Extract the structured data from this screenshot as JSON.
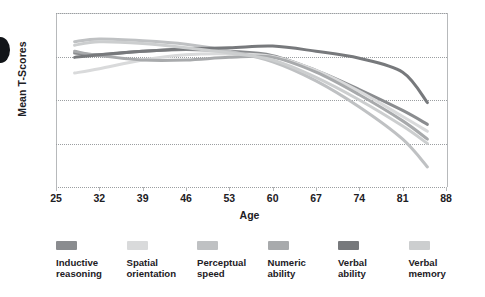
{
  "chart_data": {
    "type": "line",
    "title": "",
    "xlabel": "Age",
    "ylabel": "Mean T-Scores",
    "xlim": [
      25,
      88
    ],
    "ylim": [
      35,
      55
    ],
    "xticks": [
      "25",
      "32",
      "39",
      "46",
      "53",
      "60",
      "67",
      "74",
      "81",
      "88"
    ],
    "yticks": [
      "55",
      "50",
      "45",
      "40",
      "35"
    ],
    "grid": "horizontal-dotted",
    "legend_position": "bottom",
    "x": [
      28,
      32,
      39,
      46,
      53,
      60,
      67,
      74,
      81,
      85
    ],
    "series": [
      {
        "name": "Inductive reasoning",
        "color": "#8a8c8f",
        "values": [
          50.4,
          50.2,
          50.6,
          50.8,
          50.6,
          50.1,
          48.4,
          46.2,
          43.8,
          42.2
        ]
      },
      {
        "name": "Spatial orientation",
        "color": "#d9dadb",
        "values": [
          48.1,
          48.6,
          49.6,
          50.2,
          50.3,
          50.0,
          48.4,
          46.0,
          43.1,
          41.4
        ]
      },
      {
        "name": "Perceptual speed",
        "color": "#bfc1c3",
        "values": [
          51.7,
          52.0,
          51.8,
          51.4,
          50.6,
          49.4,
          47.2,
          44.2,
          40.5,
          37.3
        ]
      },
      {
        "name": "Numeric ability",
        "color": "#a8aaac",
        "values": [
          50.6,
          50.1,
          49.6,
          49.6,
          49.9,
          49.9,
          48.2,
          45.6,
          42.6,
          40.5
        ]
      },
      {
        "name": "Verbal ability",
        "color": "#77797c",
        "values": [
          49.9,
          50.2,
          50.6,
          50.9,
          51.0,
          51.2,
          50.6,
          49.8,
          48.2,
          44.7
        ]
      },
      {
        "name": "Verbal memory",
        "color": "#cccecf",
        "values": [
          51.3,
          51.7,
          51.5,
          51.0,
          50.4,
          49.6,
          47.6,
          45.0,
          42.0,
          40.0
        ]
      }
    ]
  },
  "axes": {
    "y_title": "Mean T-Scores",
    "x_title": "Age",
    "y_tick_labels": [
      "55",
      "50",
      "45",
      "40",
      "35"
    ],
    "x_tick_labels": [
      "25",
      "32",
      "39",
      "46",
      "53",
      "60",
      "67",
      "74",
      "81",
      "88"
    ]
  },
  "legend": {
    "items": [
      {
        "label_line1": "Inductive",
        "label_line2": "reasoning",
        "color": "#8a8c8f"
      },
      {
        "label_line1": "Spatial",
        "label_line2": "orientation",
        "color": "#d9dadb"
      },
      {
        "label_line1": "Perceptual",
        "label_line2": "speed",
        "color": "#bfc1c3"
      },
      {
        "label_line1": "Numeric",
        "label_line2": "ability",
        "color": "#a8aaac"
      },
      {
        "label_line1": "Verbal",
        "label_line2": "ability",
        "color": "#77797c"
      },
      {
        "label_line1": "Verbal",
        "label_line2": "memory",
        "color": "#cccecf"
      }
    ]
  },
  "decor": {
    "edge_marker": "black-half-circle"
  }
}
